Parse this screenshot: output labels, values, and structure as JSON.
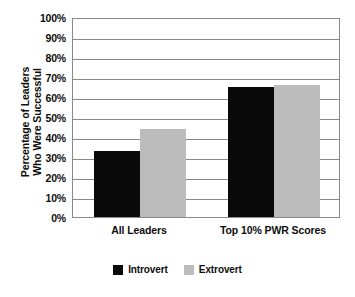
{
  "chart_data": {
    "type": "bar",
    "title": "",
    "subtitle": "",
    "xlabel": "",
    "ylabel": "Percentage of Leaders Who Were Successful",
    "ylabel_lines": [
      "Percentage of Leaders",
      "Who Were Successful"
    ],
    "categories": [
      "All Leaders",
      "Top 10% PWR Scores"
    ],
    "series": [
      {
        "name": "Introvert",
        "color": "#0a0a0a",
        "values": [
          33,
          65
        ]
      },
      {
        "name": "Extrovert",
        "color": "#bcbcbc",
        "values": [
          44,
          66
        ]
      }
    ],
    "ylim": [
      0,
      100
    ],
    "ytick_values": [
      0,
      10,
      20,
      30,
      40,
      50,
      60,
      70,
      80,
      90,
      100
    ],
    "ytick_labels": [
      "0%",
      "10%",
      "20%",
      "30%",
      "40%",
      "50%",
      "60%",
      "70%",
      "80%",
      "90%",
      "100%"
    ],
    "grid": true,
    "grid_axis": "y",
    "legend": [
      "Introvert",
      "Extrovert"
    ],
    "legend_position": "bottom-center",
    "value_suffix": "%",
    "plot_background": "#ffffff",
    "axis_color": "#8a8a8a",
    "text_color": "#0d0d0d"
  }
}
